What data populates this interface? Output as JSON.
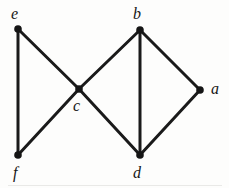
{
  "figure": {
    "kind": "undirected-graph-diagram",
    "width": 229,
    "height": 188,
    "background_color": "#fdfdfc",
    "stroke_color": "#1a1a1a",
    "vertex_fill_color": "#151515",
    "label_color": "#161616",
    "edge_stroke_width": 3,
    "vertex_radius": 3.8
  },
  "chart_data": {
    "type": "diagram",
    "title": "",
    "vertices": [
      {
        "id": "e",
        "label": "e",
        "x": 18,
        "y": 29,
        "label_x": 11,
        "label_y": 6,
        "label_anchor": "above-left"
      },
      {
        "id": "b",
        "label": "b",
        "x": 140,
        "y": 30,
        "label_x": 133,
        "label_y": 6,
        "label_anchor": "above"
      },
      {
        "id": "c",
        "label": "c",
        "x": 79,
        "y": 89,
        "label_x": 73,
        "label_y": 98,
        "label_anchor": "below-left"
      },
      {
        "id": "a",
        "label": "a",
        "x": 200,
        "y": 90,
        "label_x": 211,
        "label_y": 81,
        "label_anchor": "right"
      },
      {
        "id": "f",
        "label": "f",
        "x": 18,
        "y": 155,
        "label_x": 13,
        "label_y": 165,
        "label_anchor": "below"
      },
      {
        "id": "d",
        "label": "d",
        "x": 140,
        "y": 155,
        "label_x": 133,
        "label_y": 165,
        "label_anchor": "below"
      }
    ],
    "edges": [
      {
        "from": "e",
        "to": "f"
      },
      {
        "from": "e",
        "to": "c"
      },
      {
        "from": "f",
        "to": "c"
      },
      {
        "from": "c",
        "to": "b"
      },
      {
        "from": "c",
        "to": "d"
      },
      {
        "from": "b",
        "to": "d"
      },
      {
        "from": "b",
        "to": "a"
      },
      {
        "from": "a",
        "to": "d"
      }
    ],
    "vertex_count": 6,
    "edge_count": 8,
    "degrees": {
      "a": 2,
      "b": 3,
      "c": 4,
      "d": 3,
      "e": 2,
      "f": 2
    }
  }
}
